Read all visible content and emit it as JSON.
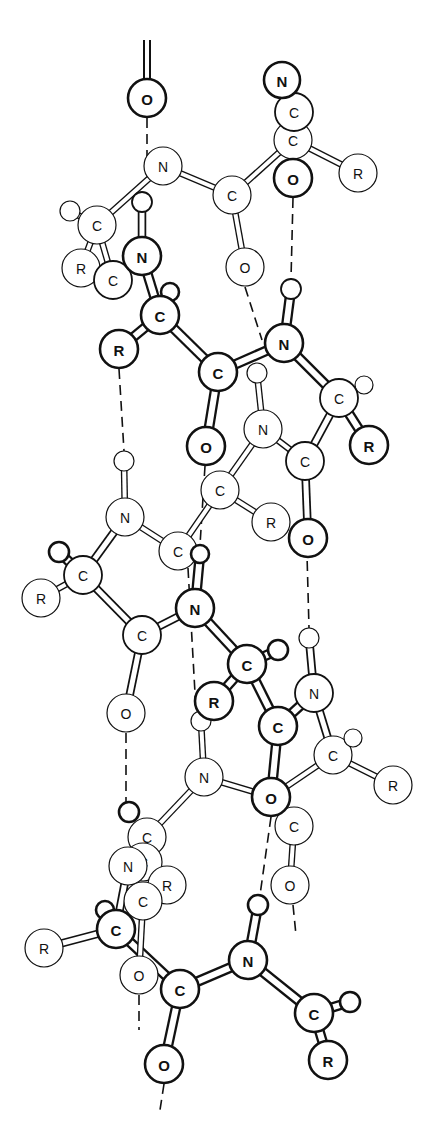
{
  "colors": {
    "stroke": "#111111",
    "fill": "#ffffff",
    "background": "#ffffff"
  },
  "atoms": [
    {
      "id": "a1",
      "el": "O",
      "x": 147,
      "y": 98,
      "r": 19,
      "w": "heavy"
    },
    {
      "id": "a2",
      "el": "N",
      "x": 282,
      "y": 80,
      "r": 18,
      "w": "heavy"
    },
    {
      "id": "a3",
      "el": "C",
      "x": 294,
      "y": 112,
      "r": 19,
      "w": "mid"
    },
    {
      "id": "a4",
      "el": "C",
      "x": 293,
      "y": 140,
      "r": 19,
      "w": "light"
    },
    {
      "id": "a5",
      "el": "O",
      "x": 293,
      "y": 178,
      "r": 19,
      "w": "heavy"
    },
    {
      "id": "a6",
      "el": "R",
      "x": 358,
      "y": 173,
      "r": 19,
      "w": "light"
    },
    {
      "id": "a7",
      "el": "N",
      "x": 163,
      "y": 166,
      "r": 19,
      "w": "light"
    },
    {
      "id": "a8",
      "el": "C",
      "x": 232,
      "y": 195,
      "r": 19,
      "w": "light"
    },
    {
      "id": "a9",
      "el": "H",
      "x": 142,
      "y": 202,
      "r": 10,
      "w": "mid"
    },
    {
      "id": "a10",
      "el": "H",
      "x": 70,
      "y": 211,
      "r": 10,
      "w": "light"
    },
    {
      "id": "a11",
      "el": "C",
      "x": 97,
      "y": 225,
      "r": 19,
      "w": "light"
    },
    {
      "id": "a12",
      "el": "O",
      "x": 245,
      "y": 267,
      "r": 19,
      "w": "light"
    },
    {
      "id": "a13",
      "el": "H",
      "x": 291,
      "y": 289,
      "r": 10,
      "w": "mid"
    },
    {
      "id": "a14",
      "el": "R",
      "x": 81,
      "y": 268,
      "r": 19,
      "w": "light"
    },
    {
      "id": "a15",
      "el": "C",
      "x": 113,
      "y": 280,
      "r": 19,
      "w": "mid"
    },
    {
      "id": "a16",
      "el": "N",
      "x": 142,
      "y": 256,
      "r": 19,
      "w": "heavy"
    },
    {
      "id": "a17",
      "el": "H",
      "x": 170,
      "y": 292,
      "r": 9,
      "w": "heavy"
    },
    {
      "id": "a18",
      "el": "C",
      "x": 160,
      "y": 315,
      "r": 19,
      "w": "heavy"
    },
    {
      "id": "a19",
      "el": "R",
      "x": 119,
      "y": 349,
      "r": 19,
      "w": "heavy"
    },
    {
      "id": "a20",
      "el": "C",
      "x": 218,
      "y": 372,
      "r": 19,
      "w": "heavy"
    },
    {
      "id": "a21",
      "el": "N",
      "x": 284,
      "y": 343,
      "r": 19,
      "w": "heavy"
    },
    {
      "id": "a22",
      "el": "H",
      "x": 257,
      "y": 373,
      "r": 10,
      "w": "light"
    },
    {
      "id": "a23",
      "el": "C",
      "x": 339,
      "y": 398,
      "r": 19,
      "w": "mid"
    },
    {
      "id": "a24",
      "el": "H",
      "x": 364,
      "y": 385,
      "r": 9,
      "w": "light"
    },
    {
      "id": "a25",
      "el": "R",
      "x": 369,
      "y": 445,
      "r": 19,
      "w": "heavy"
    },
    {
      "id": "a26",
      "el": "N",
      "x": 263,
      "y": 429,
      "r": 19,
      "w": "light"
    },
    {
      "id": "a27",
      "el": "C",
      "x": 305,
      "y": 461,
      "r": 19,
      "w": "mid"
    },
    {
      "id": "a28",
      "el": "O",
      "x": 206,
      "y": 446,
      "r": 19,
      "w": "heavy"
    },
    {
      "id": "a29",
      "el": "H",
      "x": 124,
      "y": 461,
      "r": 10,
      "w": "light"
    },
    {
      "id": "a30",
      "el": "C",
      "x": 220,
      "y": 490,
      "r": 19,
      "w": "light"
    },
    {
      "id": "a31",
      "el": "R",
      "x": 271,
      "y": 522,
      "r": 19,
      "w": "light"
    },
    {
      "id": "a32",
      "el": "O",
      "x": 308,
      "y": 538,
      "r": 19,
      "w": "heavy"
    },
    {
      "id": "a33",
      "el": "N",
      "x": 125,
      "y": 517,
      "r": 19,
      "w": "light"
    },
    {
      "id": "a34",
      "el": "C",
      "x": 178,
      "y": 551,
      "r": 19,
      "w": "light"
    },
    {
      "id": "a35",
      "el": "H",
      "x": 200,
      "y": 554,
      "r": 9,
      "w": "heavy"
    },
    {
      "id": "a36",
      "el": "H",
      "x": 59,
      "y": 552,
      "r": 10,
      "w": "heavy"
    },
    {
      "id": "a37",
      "el": "C",
      "x": 83,
      "y": 575,
      "r": 19,
      "w": "mid"
    },
    {
      "id": "a38",
      "el": "R",
      "x": 41,
      "y": 598,
      "r": 19,
      "w": "light"
    },
    {
      "id": "a39",
      "el": "C",
      "x": 142,
      "y": 635,
      "r": 19,
      "w": "mid"
    },
    {
      "id": "a40",
      "el": "N",
      "x": 195,
      "y": 608,
      "r": 19,
      "w": "heavy"
    },
    {
      "id": "a41",
      "el": "H",
      "x": 309,
      "y": 638,
      "r": 10,
      "w": "light"
    },
    {
      "id": "a42",
      "el": "C",
      "x": 247,
      "y": 664,
      "r": 19,
      "w": "heavy"
    },
    {
      "id": "a43",
      "el": "H",
      "x": 278,
      "y": 650,
      "r": 10,
      "w": "heavy"
    },
    {
      "id": "a44",
      "el": "R",
      "x": 214,
      "y": 701,
      "r": 19,
      "w": "heavy"
    },
    {
      "id": "a45",
      "el": "N",
      "x": 314,
      "y": 693,
      "r": 19,
      "w": "mid"
    },
    {
      "id": "a46",
      "el": "O",
      "x": 126,
      "y": 713,
      "r": 19,
      "w": "light"
    },
    {
      "id": "a47",
      "el": "H",
      "x": 201,
      "y": 721,
      "r": 10,
      "w": "light"
    },
    {
      "id": "a48",
      "el": "C",
      "x": 278,
      "y": 726,
      "r": 19,
      "w": "heavy"
    },
    {
      "id": "a49",
      "el": "C",
      "x": 333,
      "y": 755,
      "r": 19,
      "w": "light"
    },
    {
      "id": "a50",
      "el": "H",
      "x": 353,
      "y": 738,
      "r": 9,
      "w": "light"
    },
    {
      "id": "a51",
      "el": "R",
      "x": 393,
      "y": 785,
      "r": 19,
      "w": "light"
    },
    {
      "id": "a52",
      "el": "N",
      "x": 204,
      "y": 777,
      "r": 19,
      "w": "light"
    },
    {
      "id": "a53",
      "el": "O",
      "x": 271,
      "y": 797,
      "r": 19,
      "w": "heavy"
    },
    {
      "id": "a54",
      "el": "C",
      "x": 294,
      "y": 826,
      "r": 19,
      "w": "light"
    },
    {
      "id": "a55",
      "el": "H",
      "x": 129,
      "y": 812,
      "r": 10,
      "w": "heavy"
    },
    {
      "id": "a56",
      "el": "C",
      "x": 147,
      "y": 837,
      "r": 19,
      "w": "light"
    },
    {
      "id": "a57",
      "el": "C",
      "x": 143,
      "y": 862,
      "r": 19,
      "w": "light"
    },
    {
      "id": "a58",
      "el": "R",
      "x": 167,
      "y": 885,
      "r": 19,
      "w": "light"
    },
    {
      "id": "a59",
      "el": "N",
      "x": 128,
      "y": 866,
      "r": 19,
      "w": "light"
    },
    {
      "id": "a60",
      "el": "O",
      "x": 290,
      "y": 885,
      "r": 19,
      "w": "light"
    },
    {
      "id": "a61",
      "el": "C",
      "x": 143,
      "y": 901,
      "r": 19,
      "w": "light"
    },
    {
      "id": "a62",
      "el": "H",
      "x": 105,
      "y": 910,
      "r": 9,
      "w": "heavy"
    },
    {
      "id": "a63",
      "el": "C",
      "x": 114,
      "y:": 0,
      "y2": 0,
      "skip": true
    },
    {
      "id": "a64",
      "el": "C",
      "x": 116,
      "y": 929,
      "r": 19,
      "w": "heavy"
    },
    {
      "id": "a65",
      "el": "R",
      "x": 44,
      "y": 948,
      "r": 19,
      "w": "light"
    },
    {
      "id": "a66",
      "el": "O",
      "x": 139,
      "y": 975,
      "r": 19,
      "w": "light"
    },
    {
      "id": "a67",
      "el": "H",
      "x": 258,
      "y": 905,
      "r": 10,
      "w": "heavy"
    },
    {
      "id": "a68",
      "el": "N",
      "x": 248,
      "y": 960,
      "r": 19,
      "w": "heavy"
    },
    {
      "id": "a69",
      "el": "C",
      "x": 180,
      "y": 989,
      "r": 19,
      "w": "heavy"
    },
    {
      "id": "a70",
      "el": "C",
      "x": 314,
      "y": 1013,
      "r": 19,
      "w": "heavy"
    },
    {
      "id": "a71",
      "el": "H",
      "x": 350,
      "y": 1002,
      "r": 10,
      "w": "heavy"
    },
    {
      "id": "a72",
      "el": "R",
      "x": 328,
      "y": 1060,
      "r": 19,
      "w": "heavy"
    },
    {
      "id": "a73",
      "el": "O",
      "x": 164,
      "y": 1064,
      "r": 19,
      "w": "heavy"
    }
  ],
  "bonds": [
    [
      "a7",
      "a8",
      "light"
    ],
    [
      "a8",
      "a4",
      "light"
    ],
    [
      "a4",
      "a6",
      "light"
    ],
    [
      "a8",
      "a12",
      "light"
    ],
    [
      "a7",
      "a11",
      "light"
    ],
    [
      "a11",
      "a10",
      "light"
    ],
    [
      "a11",
      "a14",
      "light"
    ],
    [
      "a11",
      "a15",
      "light"
    ],
    [
      "a2",
      "a3",
      "mid"
    ],
    [
      "a3",
      "a5",
      "mid"
    ],
    [
      "a9",
      "a16",
      "mid"
    ],
    [
      "a16",
      "a18",
      "heavy"
    ],
    [
      "a18",
      "a17",
      "heavy"
    ],
    [
      "a18",
      "a19",
      "heavy"
    ],
    [
      "a18",
      "a20",
      "heavy"
    ],
    [
      "a20",
      "a21",
      "heavy"
    ],
    [
      "a20",
      "a28",
      "heavy"
    ],
    [
      "a21",
      "a13",
      "heavy"
    ],
    [
      "a21",
      "a23",
      "heavy"
    ],
    [
      "a23",
      "a24",
      "light"
    ],
    [
      "a23",
      "a25",
      "heavy"
    ],
    [
      "a23",
      "a27",
      "mid"
    ],
    [
      "a27",
      "a26",
      "light"
    ],
    [
      "a26",
      "a22",
      "light"
    ],
    [
      "a26",
      "a30",
      "light"
    ],
    [
      "a27",
      "a32",
      "mid"
    ],
    [
      "a30",
      "a31",
      "light"
    ],
    [
      "a30",
      "a34",
      "light"
    ],
    [
      "a33",
      "a29",
      "light"
    ],
    [
      "a33",
      "a34",
      "light"
    ],
    [
      "a33",
      "a37",
      "mid"
    ],
    [
      "a37",
      "a36",
      "heavy"
    ],
    [
      "a37",
      "a38",
      "light"
    ],
    [
      "a37",
      "a39",
      "mid"
    ],
    [
      "a39",
      "a40",
      "mid"
    ],
    [
      "a39",
      "a46",
      "mid"
    ],
    [
      "a40",
      "a35",
      "heavy"
    ],
    [
      "a40",
      "a42",
      "heavy"
    ],
    [
      "a42",
      "a43",
      "heavy"
    ],
    [
      "a42",
      "a44",
      "heavy"
    ],
    [
      "a42",
      "a48",
      "heavy"
    ],
    [
      "a48",
      "a45",
      "heavy"
    ],
    [
      "a48",
      "a53",
      "heavy"
    ],
    [
      "a45",
      "a41",
      "mid"
    ],
    [
      "a45",
      "a49",
      "mid"
    ],
    [
      "a49",
      "a50",
      "light"
    ],
    [
      "a49",
      "a51",
      "light"
    ],
    [
      "a49",
      "a53",
      "light"
    ],
    [
      "a52",
      "a47",
      "light"
    ],
    [
      "a52",
      "a53",
      "light"
    ],
    [
      "a52",
      "a56",
      "light"
    ],
    [
      "a54",
      "a60",
      "light"
    ],
    [
      "a56",
      "a59",
      "light"
    ],
    [
      "a59",
      "a64",
      "mid"
    ],
    [
      "a57",
      "a58",
      "light"
    ],
    [
      "a64",
      "a62",
      "heavy"
    ],
    [
      "a64",
      "a65",
      "mid"
    ],
    [
      "a64",
      "a69",
      "heavy"
    ],
    [
      "a69",
      "a68",
      "heavy"
    ],
    [
      "a68",
      "a67",
      "heavy"
    ],
    [
      "a68",
      "a70",
      "heavy"
    ],
    [
      "a70",
      "a71",
      "heavy"
    ],
    [
      "a70",
      "a72",
      "heavy"
    ],
    [
      "a69",
      "a73",
      "heavy"
    ],
    [
      "a61",
      "a66",
      "light"
    ]
  ],
  "hbonds": [
    [
      147,
      40,
      147,
      78,
      "double-top"
    ],
    [
      147,
      118,
      147,
      166
    ],
    [
      293,
      198,
      291,
      279
    ],
    [
      119,
      369,
      124,
      451
    ],
    [
      245,
      287,
      262,
      340
    ],
    [
      218,
      392,
      206,
      426
    ],
    [
      205,
      466,
      200,
      545
    ],
    [
      305,
      481,
      309,
      628
    ],
    [
      126,
      733,
      126,
      802
    ],
    [
      188,
      568,
      196,
      711
    ],
    [
      271,
      817,
      260,
      895
    ],
    [
      139,
      995,
      139,
      1030
    ],
    [
      164,
      1084,
      160,
      1110
    ],
    [
      293,
      905,
      296,
      935
    ]
  ]
}
